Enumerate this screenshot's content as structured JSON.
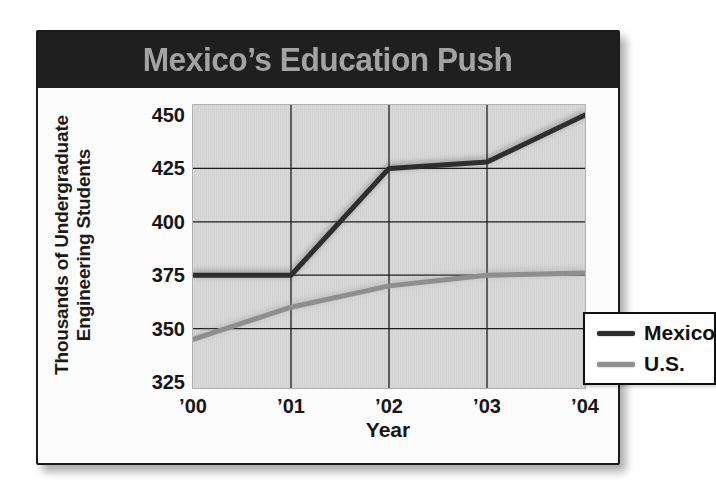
{
  "header": {
    "title": "Mexico’s Education Push"
  },
  "chart": {
    "y_axis_label_line1": "Thousands of Undergraduate",
    "y_axis_label_line2": "Engineering Students",
    "x_axis_label": "Year"
  },
  "colors": {
    "header_bg": "#1f1f1f",
    "title_color": "#a3a3a3",
    "plot_bg": "#d6d6d6",
    "grid": "#1c1c1c",
    "mexico_line": "#2e2e2e",
    "us_line": "#8e8e8e"
  },
  "chart_data": {
    "type": "line",
    "title": "Mexico’s Education Push",
    "xlabel": "Year",
    "ylabel": "Thousands of Undergraduate Engineering Students",
    "categories": [
      "’00",
      "’01",
      "’02",
      "’03",
      "’04"
    ],
    "series": [
      {
        "name": "Mexico",
        "color": "#2e2e2e",
        "values": [
          375,
          375,
          425,
          428,
          450
        ]
      },
      {
        "name": "U.S.",
        "color": "#8e8e8e",
        "values": [
          345,
          360,
          370,
          375,
          376
        ]
      }
    ],
    "ylim": [
      325,
      450
    ],
    "yticks": [
      325,
      350,
      375,
      400,
      425,
      450
    ],
    "grid": true,
    "legend_position": "lower right"
  }
}
